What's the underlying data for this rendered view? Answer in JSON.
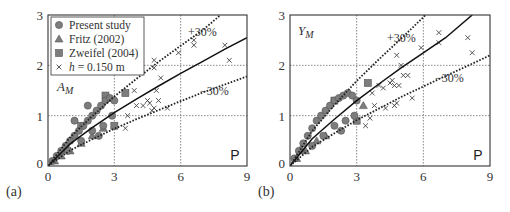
{
  "chart_data": [
    {
      "panel": "(a)",
      "type": "scatter",
      "quantity_label": "A_M",
      "corner_label": "P",
      "xlabel": "P",
      "ylabel": "A_M",
      "xlim": [
        0,
        9
      ],
      "ylim": [
        0,
        3
      ],
      "xticks": [
        0,
        3,
        6,
        9
      ],
      "yticks": [
        0,
        1,
        2,
        3
      ],
      "grid": true,
      "legend_position": "upper left",
      "legend": [
        {
          "marker": "circle",
          "label": "Present study"
        },
        {
          "marker": "triangle",
          "label": "Fritz (2002)"
        },
        {
          "marker": "square",
          "label": "Zweifel (2004)"
        },
        {
          "marker": "x",
          "label": "h = 0.150 m"
        }
      ],
      "lines": [
        {
          "name": "fit",
          "style": "solid",
          "x": [
            0,
            1,
            2,
            3,
            4,
            5,
            6,
            7,
            8,
            9
          ],
          "y": [
            0,
            0.44,
            0.76,
            1.06,
            1.33,
            1.59,
            1.84,
            2.08,
            2.32,
            2.55
          ]
        },
        {
          "name": "+30%",
          "style": "dotted",
          "x": [
            0,
            1,
            2,
            3,
            4,
            5,
            6,
            7,
            7.8
          ],
          "y": [
            0,
            0.57,
            0.99,
            1.38,
            1.73,
            2.07,
            2.39,
            2.7,
            3.0
          ]
        },
        {
          "name": "-30%",
          "style": "dotted",
          "x": [
            0,
            1,
            2,
            3,
            4,
            5,
            6,
            7,
            8,
            9
          ],
          "y": [
            0,
            0.31,
            0.53,
            0.74,
            0.93,
            1.11,
            1.29,
            1.46,
            1.62,
            1.78
          ]
        }
      ],
      "annotations": [
        "+30%",
        "-30%"
      ],
      "series": [
        {
          "name": "Present study",
          "marker": "circle",
          "points": [
            [
              0.2,
              0.1
            ],
            [
              0.4,
              0.2
            ],
            [
              0.6,
              0.3
            ],
            [
              0.8,
              0.4
            ],
            [
              1.0,
              0.5
            ],
            [
              1.2,
              0.6
            ],
            [
              1.4,
              0.7
            ],
            [
              1.6,
              0.8
            ],
            [
              1.8,
              0.9
            ],
            [
              2.0,
              1.0
            ],
            [
              2.2,
              1.1
            ],
            [
              2.4,
              1.2
            ],
            [
              2.6,
              1.3
            ],
            [
              2.8,
              1.35
            ],
            [
              3.0,
              1.3
            ],
            [
              1.5,
              0.5
            ],
            [
              2.0,
              0.7
            ],
            [
              2.5,
              0.8
            ],
            [
              1.2,
              0.9
            ],
            [
              1.8,
              1.2
            ],
            [
              2.3,
              0.6
            ],
            [
              0.9,
              0.3
            ],
            [
              2.9,
              1.0
            ]
          ]
        },
        {
          "name": "Fritz (2002)",
          "marker": "triangle",
          "points": [
            [
              0.3,
              0.1
            ],
            [
              0.6,
              0.2
            ],
            [
              1.0,
              0.3
            ],
            [
              1.5,
              0.45
            ],
            [
              2.0,
              0.6
            ],
            [
              2.5,
              0.75
            ]
          ]
        },
        {
          "name": "Zweifel (2004)",
          "marker": "square",
          "points": [
            [
              3.5,
              1.45
            ],
            [
              3.0,
              0.8
            ],
            [
              2.6,
              1.4
            ],
            [
              1.5,
              0.8
            ]
          ]
        },
        {
          "name": "h = 0.150 m",
          "marker": "x",
          "points": [
            [
              3.5,
              0.75
            ],
            [
              3.6,
              1.0
            ],
            [
              3.9,
              1.5
            ],
            [
              4.0,
              1.2
            ],
            [
              4.3,
              1.2
            ],
            [
              4.5,
              1.3
            ],
            [
              4.6,
              1.25
            ],
            [
              4.7,
              1.1
            ],
            [
              4.8,
              1.15
            ],
            [
              4.8,
              2.1
            ],
            [
              4.8,
              1.95
            ],
            [
              4.9,
              1.5
            ],
            [
              5.0,
              1.3
            ],
            [
              5.1,
              1.75
            ],
            [
              5.4,
              1.15
            ],
            [
              5.9,
              2.25
            ],
            [
              6.6,
              2.5
            ],
            [
              6.6,
              2.4
            ],
            [
              8.0,
              2.4
            ],
            [
              8.2,
              2.1
            ]
          ]
        }
      ]
    },
    {
      "panel": "(b)",
      "type": "scatter",
      "quantity_label": "Y_M",
      "corner_label": "P",
      "xlabel": "P",
      "ylabel": "Y_M",
      "xlim": [
        0,
        9
      ],
      "ylim": [
        0,
        3
      ],
      "xticks": [
        0,
        3,
        6,
        9
      ],
      "yticks": [
        0,
        1,
        2,
        3
      ],
      "grid": true,
      "lines": [
        {
          "name": "fit",
          "style": "solid",
          "x": [
            0,
            1,
            2,
            3,
            4,
            5,
            6,
            7,
            8.2
          ],
          "y": [
            0,
            0.54,
            0.93,
            1.3,
            1.63,
            1.95,
            2.25,
            2.55,
            3.0
          ]
        },
        {
          "name": "+30%",
          "style": "dotted",
          "x": [
            0,
            1,
            2,
            3,
            4,
            5,
            6.1
          ],
          "y": [
            0,
            0.7,
            1.21,
            1.69,
            2.12,
            2.53,
            3.0
          ]
        },
        {
          "name": "-30%",
          "style": "dotted",
          "x": [
            0,
            1,
            2,
            3,
            4,
            5,
            6,
            7,
            8,
            9
          ],
          "y": [
            0,
            0.38,
            0.65,
            0.91,
            1.14,
            1.37,
            1.58,
            1.79,
            1.99,
            2.2
          ]
        }
      ],
      "annotations": [
        "+30%",
        "-30%"
      ],
      "series": [
        {
          "name": "Present study",
          "marker": "circle",
          "points": [
            [
              0.2,
              0.15
            ],
            [
              0.4,
              0.3
            ],
            [
              0.6,
              0.45
            ],
            [
              0.8,
              0.6
            ],
            [
              1.0,
              0.75
            ],
            [
              1.2,
              0.9
            ],
            [
              1.4,
              1.0
            ],
            [
              1.6,
              1.1
            ],
            [
              1.8,
              1.2
            ],
            [
              2.0,
              1.3
            ],
            [
              2.2,
              1.35
            ],
            [
              2.4,
              1.4
            ],
            [
              2.6,
              1.45
            ],
            [
              2.8,
              1.4
            ],
            [
              3.0,
              1.3
            ],
            [
              1.5,
              0.6
            ],
            [
              2.0,
              0.8
            ],
            [
              2.5,
              0.9
            ],
            [
              2.9,
              1.0
            ],
            [
              1.0,
              0.4
            ],
            [
              2.3,
              0.7
            ]
          ]
        },
        {
          "name": "Fritz (2002)",
          "marker": "triangle",
          "points": [
            [
              0.3,
              0.15
            ],
            [
              0.7,
              0.3
            ],
            [
              1.2,
              0.5
            ],
            [
              1.6,
              0.6
            ],
            [
              3.3,
              1.2
            ],
            [
              0.5,
              0.35
            ]
          ]
        },
        {
          "name": "Zweifel (2004)",
          "marker": "square",
          "points": [
            [
              3.5,
              1.65
            ],
            [
              3.0,
              0.9
            ],
            [
              2.0,
              1.3
            ]
          ]
        },
        {
          "name": "h = 0.150 m",
          "marker": "x",
          "points": [
            [
              3.4,
              0.8
            ],
            [
              3.6,
              0.95
            ],
            [
              3.7,
              1.45
            ],
            [
              3.8,
              1.2
            ],
            [
              4.0,
              1.6
            ],
            [
              4.2,
              1.55
            ],
            [
              4.3,
              1.15
            ],
            [
              4.5,
              1.65
            ],
            [
              4.6,
              1.7
            ],
            [
              4.7,
              1.6
            ],
            [
              4.7,
              1.2
            ],
            [
              4.8,
              1.25
            ],
            [
              4.8,
              2.2
            ],
            [
              4.9,
              1.6
            ],
            [
              5.0,
              2.0
            ],
            [
              5.1,
              1.8
            ],
            [
              5.3,
              1.8
            ],
            [
              5.5,
              1.35
            ],
            [
              5.9,
              2.35
            ],
            [
              6.7,
              2.65
            ],
            [
              6.7,
              2.45
            ],
            [
              8.0,
              2.55
            ],
            [
              8.2,
              2.25
            ]
          ]
        }
      ]
    }
  ],
  "figure": {
    "panels": [
      {
        "label": "(a)",
        "quantity": "A",
        "quantity_sub": "M",
        "corner": "P",
        "annotation_plus": "+30%",
        "annotation_minus": "−30%"
      },
      {
        "label": "(b)",
        "quantity": "Y",
        "quantity_sub": "M",
        "corner": "P",
        "annotation_plus": "+30%",
        "annotation_minus": "−30%"
      }
    ],
    "ticks": {
      "x": [
        "0",
        "3",
        "6",
        "9"
      ],
      "y": [
        "0",
        "1",
        "2",
        "3"
      ]
    },
    "legend": {
      "items": [
        {
          "label": "Present study"
        },
        {
          "label": "Fritz (2002)"
        },
        {
          "label": "Zweifel (2004)"
        },
        {
          "label_pre": "h",
          "label_post": " = 0.150 m"
        }
      ]
    },
    "colors": {
      "marker_fill": "#7d7d7d",
      "marker_edge": "#555555",
      "axes": "#333333",
      "grid": "#555555",
      "fit_line": "#111111"
    }
  }
}
